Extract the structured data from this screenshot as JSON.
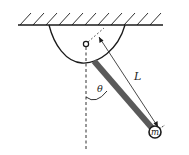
{
  "diagram": {
    "type": "physics-pendulum",
    "labels": {
      "length": "L",
      "angle": "θ",
      "mass": "m"
    },
    "colors": {
      "line": "#1a1a1a",
      "rod": "#5a5a5a",
      "background": "#ffffff"
    }
  }
}
